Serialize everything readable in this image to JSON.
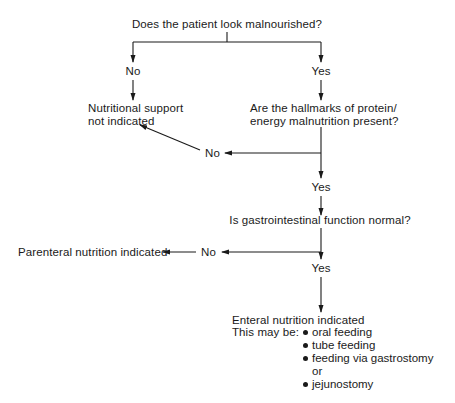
{
  "diagram": {
    "q1": "Does the patient look malnourished?",
    "q1_no": "No",
    "q1_yes": "Yes",
    "no_support": [
      "Nutritional support",
      "not indicated"
    ],
    "q2": [
      "Are the hallmarks of protein/",
      "energy malnutrition present?"
    ],
    "q2_no": "No",
    "q2_yes": "Yes",
    "q3": "Is gastrointestinal function normal?",
    "q3_no": "No",
    "q3_yes": "Yes",
    "parenteral": "Parenteral nutrition indicated",
    "enteral": {
      "title": "Enteral nutrition indicated",
      "prefix": "This may be:",
      "options": [
        "oral feeding",
        "tube feeding",
        "feeding via gastrostomy",
        "or",
        "jejunostomy"
      ]
    }
  }
}
